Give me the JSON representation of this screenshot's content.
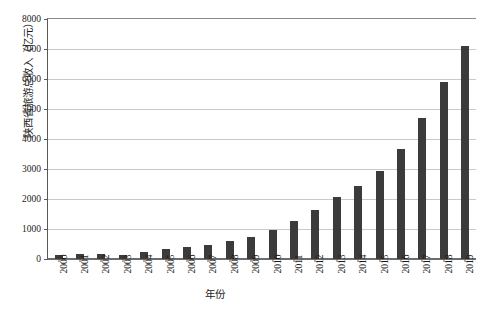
{
  "chart_data": {
    "type": "bar",
    "title": "",
    "subtitle": "",
    "xlabel": "年份",
    "ylabel": "陕西省旅游总收入（亿元）",
    "categories": [
      "2000",
      "2001",
      "2002",
      "2003",
      "2004",
      "2005",
      "2006",
      "2007",
      "2008",
      "2009",
      "2010",
      "2011",
      "2012",
      "2013",
      "2014",
      "2015",
      "2016",
      "2017",
      "2018",
      "2019"
    ],
    "values": [
      150,
      170,
      180,
      140,
      250,
      330,
      390,
      470,
      600,
      750,
      960,
      1270,
      1630,
      2080,
      2440,
      2940,
      3680,
      4700,
      5900,
      7100
    ],
    "series": [
      {
        "name": "陕西省旅游总收入",
        "values": [
          150,
          170,
          180,
          140,
          250,
          330,
          390,
          470,
          600,
          750,
          960,
          1270,
          1630,
          2080,
          2440,
          2940,
          3680,
          4700,
          5900,
          7100
        ]
      }
    ],
    "ylim": [
      0,
      8000
    ],
    "ytick_labels": [
      "0",
      "1000",
      "2000",
      "3000",
      "4000",
      "5000",
      "6000",
      "7000",
      "8000"
    ],
    "ytick_values": [
      0,
      1000,
      2000,
      3000,
      4000,
      5000,
      6000,
      7000,
      8000
    ],
    "grid": true,
    "grid_axis": "y",
    "legend": false,
    "legend_position": "none",
    "bar_color": "#3b3b3b",
    "grid_color": "#c9c9c9",
    "axis_color": "#5a5a5a",
    "background_color": "#ffffff"
  }
}
